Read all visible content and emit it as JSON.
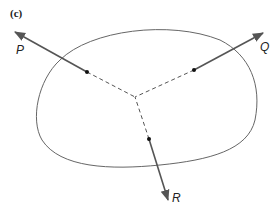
{
  "figure": {
    "panel_label": "(c)",
    "forces": [
      {
        "name": "P",
        "label": "P"
      },
      {
        "name": "Q",
        "label": "Q"
      },
      {
        "name": "R",
        "label": "R"
      }
    ],
    "colors": {
      "line": "#555555",
      "outline": "#666666",
      "dot": "#111111"
    }
  }
}
